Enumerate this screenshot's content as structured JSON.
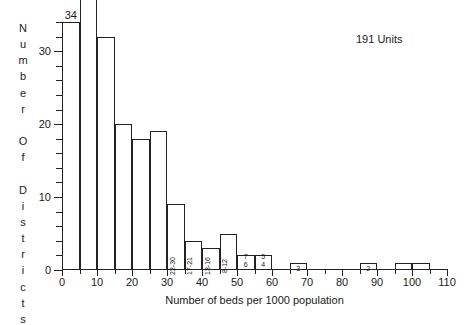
{
  "chart_data": {
    "type": "bar",
    "title": "",
    "xlabel": "Number of beds per 1000 population",
    "ylabel": "Number Of Districts",
    "annotation": "191 Units",
    "xlim": [
      0,
      110
    ],
    "ylim": [
      0,
      34
    ],
    "grid": false,
    "legend": "none",
    "bin_width": 5,
    "x_ticks": [
      0,
      10,
      20,
      30,
      40,
      50,
      60,
      70,
      80,
      90,
      100,
      110
    ],
    "x_minor_step": 5,
    "y_ticks": [
      0,
      10,
      20,
      30
    ],
    "y_minor_step": 2,
    "categories": [
      "0-5",
      "5-10",
      "10-15",
      "15-20",
      "20-25",
      "25-30",
      "30-35",
      "35-40",
      "40-45",
      "45-50",
      "50-55",
      "55-60",
      "65-70",
      "85-90",
      "95-100",
      "100-105"
    ],
    "values": [
      34,
      39,
      32,
      20,
      18,
      19,
      9,
      4,
      3,
      5,
      2,
      2,
      1,
      1,
      1,
      1
    ],
    "bars": [
      {
        "x0": 0,
        "x1": 5,
        "value": 34,
        "top_label": "34",
        "inner_label": "",
        "inner_style": "none"
      },
      {
        "x0": 5,
        "x1": 10,
        "value": 39,
        "top_label": "39",
        "inner_label": "",
        "inner_style": "none"
      },
      {
        "x0": 10,
        "x1": 15,
        "value": 32,
        "top_label": "",
        "inner_label": "",
        "inner_style": "none"
      },
      {
        "x0": 15,
        "x1": 20,
        "value": 20,
        "top_label": "",
        "inner_label": "",
        "inner_style": "none"
      },
      {
        "x0": 20,
        "x1": 25,
        "value": 18,
        "top_label": "",
        "inner_label": "",
        "inner_style": "none"
      },
      {
        "x0": 25,
        "x1": 30,
        "value": 19,
        "top_label": "",
        "inner_label": "",
        "inner_style": "none"
      },
      {
        "x0": 30,
        "x1": 35,
        "value": 9,
        "top_label": "",
        "inner_label": "22-30",
        "inner_style": "vertical"
      },
      {
        "x0": 35,
        "x1": 40,
        "value": 4,
        "top_label": "",
        "inner_label": "17-21",
        "inner_style": "vertical"
      },
      {
        "x0": 40,
        "x1": 45,
        "value": 3,
        "top_label": "",
        "inner_label": "13-16",
        "inner_style": "vertical"
      },
      {
        "x0": 45,
        "x1": 50,
        "value": 5,
        "top_label": "",
        "inner_label": "8-12",
        "inner_style": "vertical"
      },
      {
        "x0": 50,
        "x1": 55,
        "value": 2,
        "top_label": "",
        "inner_label": "7\n6",
        "inner_style": "stacked"
      },
      {
        "x0": 55,
        "x1": 60,
        "value": 2,
        "top_label": "",
        "inner_label": "5\n4",
        "inner_style": "stacked"
      },
      {
        "x0": 65,
        "x1": 70,
        "value": 1,
        "top_label": "",
        "inner_label": "3",
        "inner_style": "inline"
      },
      {
        "x0": 85,
        "x1": 90,
        "value": 1,
        "top_label": "",
        "inner_label": "2",
        "inner_style": "inline"
      },
      {
        "x0": 95,
        "x1": 100,
        "value": 1,
        "top_label": "",
        "inner_label": "",
        "inner_style": "none"
      },
      {
        "x0": 100,
        "x1": 105,
        "value": 1,
        "top_label": "",
        "inner_label": "",
        "inner_style": "none"
      }
    ]
  },
  "colors": {
    "bar_fill": "#ffffff",
    "bar_stroke": "#222222",
    "axis": "#222222",
    "text": "#1a1a1a",
    "background": "#ffffff"
  }
}
